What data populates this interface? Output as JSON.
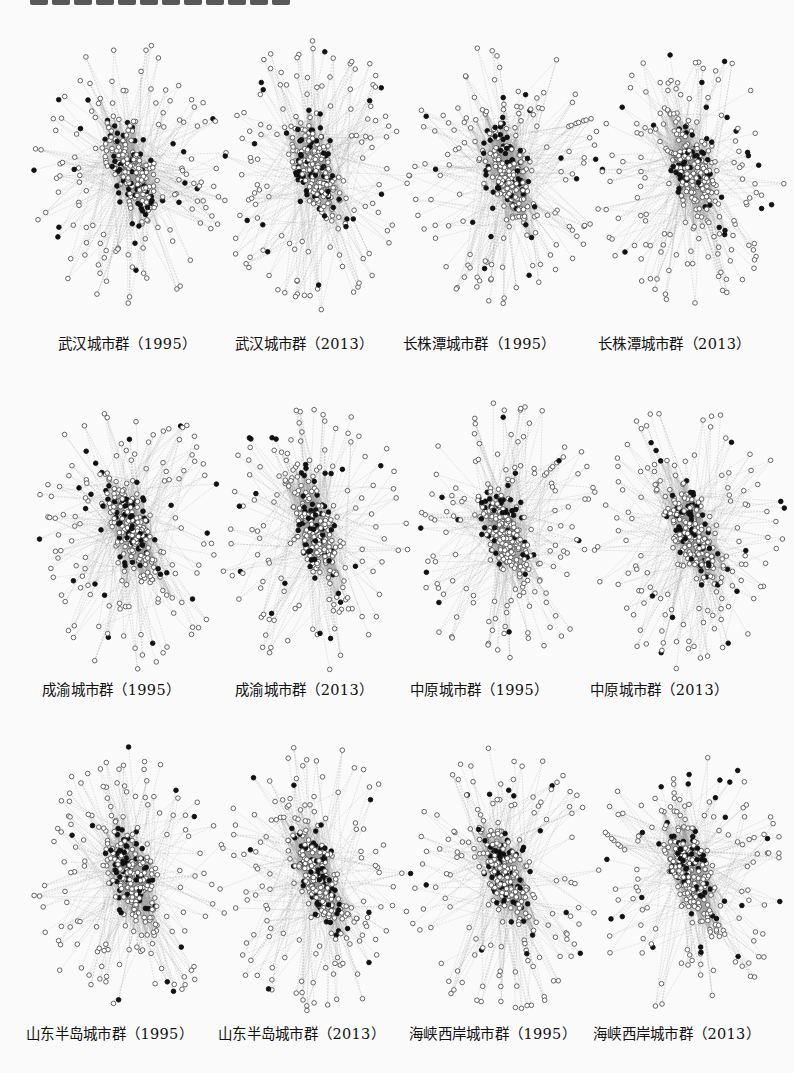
{
  "figure": {
    "panels": [
      {
        "label": "武汉城市群（1995）",
        "seed": 11,
        "x": 30,
        "y": 35,
        "lx": 58,
        "ly": 332
      },
      {
        "label": "武汉城市群（2013）",
        "seed": 23,
        "x": 215,
        "y": 35,
        "lx": 235,
        "ly": 332
      },
      {
        "label": "长株潭城市群（1995）",
        "seed": 37,
        "x": 405,
        "y": 35,
        "lx": 403,
        "ly": 332
      },
      {
        "label": "长株潭城市群（2013）",
        "seed": 53,
        "x": 590,
        "y": 35,
        "lx": 598,
        "ly": 332
      },
      {
        "label": "成渝城市群（1995）",
        "seed": 71,
        "x": 30,
        "y": 395,
        "lx": 42,
        "ly": 678
      },
      {
        "label": "成渝城市群（2013）",
        "seed": 89,
        "x": 215,
        "y": 395,
        "lx": 153,
        "ly": 678
      },
      {
        "label": "中原城市群（1995）",
        "seed": 97,
        "x": 405,
        "y": 395,
        "lx": 268,
        "ly": 678
      },
      {
        "label": "中原城市群（2013）",
        "seed": 113,
        "x": 590,
        "y": 395,
        "lx": 390,
        "ly": 678
      },
      {
        "label": "山东半岛城市群（1995）",
        "seed": 131,
        "x": 30,
        "y": 740,
        "lx": 26,
        "ly": 1022
      },
      {
        "label": "山东半岛城市群（2013）",
        "seed": 149,
        "x": 215,
        "y": 740,
        "lx": 218,
        "ly": 1022
      },
      {
        "label": "海峡西岸城市群（1995）",
        "seed": 163,
        "x": 405,
        "y": 740,
        "lx": 409,
        "ly": 1022
      },
      {
        "label": "海峡西岸城市群（2013）",
        "seed": 181,
        "x": 590,
        "y": 740,
        "lx": 593,
        "ly": 1022
      }
    ],
    "legend_nodes": {
      "filled": "#111111",
      "hollow_stroke": "#555555",
      "edge": "#9a9a9a"
    }
  }
}
